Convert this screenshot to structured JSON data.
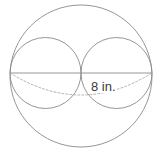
{
  "figure": {
    "name": "sphere-with-two-inscribed-spheres",
    "background_color": "#ffffff",
    "stroke_color": "#8a8a8a",
    "dashed_stroke_color": "#a9a9a9",
    "label_color": "#3a3a3a",
    "width": 161,
    "height": 155,
    "outer_circle": {
      "name": "outer-sphere-outline",
      "cx": 81,
      "cy": 76,
      "r": 71
    },
    "inner_circles": [
      {
        "name": "left-inner-sphere-outline",
        "cx": 45.5,
        "cy": 73,
        "r": 35.5
      },
      {
        "name": "right-inner-sphere-outline",
        "cx": 116.5,
        "cy": 73,
        "r": 35.5
      }
    ],
    "diameter_line": {
      "name": "horizontal-diameter-line",
      "x1": 10,
      "y1": 73,
      "x2": 152,
      "y2": 73
    },
    "dashed_equator": {
      "name": "dashed-equator-arc",
      "x1": 10,
      "y1": 73,
      "x2": 152,
      "y2": 73,
      "sag": 22,
      "dash_pattern": "2,2"
    },
    "label": {
      "text": "8 in.",
      "x": 90,
      "y": 80
    }
  }
}
